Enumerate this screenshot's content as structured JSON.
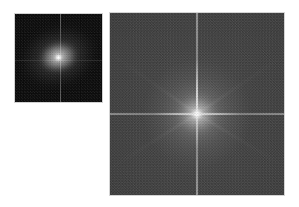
{
  "figure": {
    "name": "fft-magnitude-spectra-comparison",
    "background_color": "#ffffff",
    "width": 299,
    "height": 207,
    "caption": ""
  },
  "panels": [
    {
      "id": "panel-left",
      "name": "small-spectrum",
      "label": "",
      "type": "fft-magnitude-spectrum",
      "x": 14,
      "y": 13,
      "width": 89,
      "height": 90,
      "border_color": "#d2d2d2",
      "background_color": "#0b0b0b",
      "center_x": 59,
      "center_y": 59,
      "dc_peak_color": "#ffffff",
      "halo_shape": "elliptical",
      "halo_rotation_deg": -18,
      "noise_level": "high",
      "mean_brightness": "very-dark"
    },
    {
      "id": "panel-right",
      "name": "large-spectrum",
      "label": "",
      "type": "fft-magnitude-spectrum",
      "x": 109,
      "y": 12,
      "width": 176,
      "height": 184,
      "border_color": "#d4d4d4",
      "background_color": "#3a3a3a",
      "center_x": 196,
      "center_y": 113,
      "dc_peak_color": "#ffffff",
      "halo_shape": "circular",
      "halo_rotation_deg": 0,
      "noise_level": "high",
      "mean_brightness": "mid-gray"
    }
  ],
  "chart_data": {
    "type": "heatmap",
    "title": "",
    "subtitle": "",
    "xlabel": "",
    "ylabel": "",
    "colormap": "gray",
    "grid": false,
    "legend": "none",
    "panels": [
      {
        "name": "small-spectrum",
        "nx": 89,
        "ny": 90,
        "xlim": [
          -0.5,
          0.5
        ],
        "ylim": [
          -0.5,
          0.5
        ],
        "xticklabels": [],
        "yticklabels": [],
        "dc_component": {
          "x": 0,
          "y": 0,
          "intensity": 255
        },
        "radial_profile": {
          "radius_px": [
            0,
            2,
            5,
            10,
            18,
            28,
            40,
            55
          ],
          "intensity": [
            255,
            190,
            120,
            72,
            40,
            22,
            13,
            9
          ]
        },
        "cross_axes": {
          "vertical_x_px": 45,
          "horizontal_y_px": 46,
          "vertical_intensity": 110,
          "horizontal_intensity": 60
        },
        "corner_intensity": 11,
        "background_intensity": 13
      },
      {
        "name": "large-spectrum",
        "nx": 176,
        "ny": 184,
        "xlim": [
          -0.5,
          0.5
        ],
        "ylim": [
          -0.5,
          0.5
        ],
        "xticklabels": [],
        "yticklabels": [],
        "dc_component": {
          "x": 0,
          "y": 0,
          "intensity": 255
        },
        "radial_profile": {
          "radius_px": [
            0,
            3,
            8,
            16,
            30,
            50,
            75,
            100
          ],
          "intensity": [
            255,
            170,
            112,
            86,
            72,
            62,
            57,
            54
          ]
        },
        "cross_axes": {
          "vertical_x_px": 87,
          "horizontal_y_px": 101,
          "vertical_intensity": 205,
          "horizontal_intensity": 200
        },
        "corner_intensity": 56,
        "background_intensity": 58
      }
    ]
  }
}
